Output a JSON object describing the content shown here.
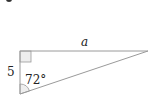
{
  "diagram": {
    "type": "right-triangle",
    "labels": {
      "hypotenuse_opposite_leg": "a",
      "vertical_leg": "5",
      "angle": "72°"
    },
    "colors": {
      "stroke": "#9a9a9a",
      "text": "#222222",
      "right_angle_fill": "#eeeeee",
      "angle_arc_fill": "#eeeeee"
    }
  }
}
